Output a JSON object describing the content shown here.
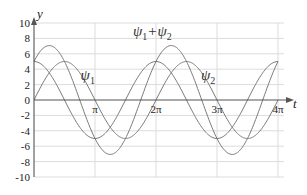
{
  "chart_data": {
    "type": "line",
    "title": "",
    "xlabel": "t",
    "ylabel": "y",
    "xlim": [
      0,
      12.566
    ],
    "ylim": [
      -10,
      10
    ],
    "grid": true,
    "x_ticks": [
      {
        "value": 3.1416,
        "label": "π"
      },
      {
        "value": 6.2832,
        "label": "2π"
      },
      {
        "value": 9.4248,
        "label": "3π"
      },
      {
        "value": 12.5664,
        "label": "4π"
      }
    ],
    "y_ticks": [
      {
        "value": 10,
        "label": "10"
      },
      {
        "value": 8,
        "label": "8"
      },
      {
        "value": 6,
        "label": "6"
      },
      {
        "value": 4,
        "label": "4"
      },
      {
        "value": 2,
        "label": "2"
      },
      {
        "value": 0,
        "label": "0"
      },
      {
        "value": -2,
        "label": "-2"
      },
      {
        "value": -4,
        "label": "-4"
      },
      {
        "value": -6,
        "label": "-6"
      },
      {
        "value": -8,
        "label": "-8"
      },
      {
        "value": -10,
        "label": "-10"
      }
    ],
    "series": [
      {
        "name": "ψ1",
        "label_main": "ψ",
        "label_sub": "1",
        "formula": "5cos(t)",
        "amplitude": 5,
        "phase": 1.5708,
        "label_at": [
          2.4,
          2.6
        ]
      },
      {
        "name": "ψ2",
        "label_main": "ψ",
        "label_sub": "2",
        "formula": "5sin(t)",
        "amplitude": 5,
        "phase": 0,
        "label_at": [
          8.6,
          2.6
        ]
      },
      {
        "name": "ψ1+ψ2",
        "label_main": "ψ",
        "label_sub": "1",
        "label_plus": "+ψ",
        "label_sub2": "2",
        "formula": "5cos(t)+5sin(t)",
        "amplitude": 7.071,
        "phase": 0.7854,
        "label_at": [
          5.1,
          8.3
        ]
      }
    ],
    "colors": {
      "curve": "#7a7a7a",
      "grid": "#dcdcdc",
      "axis": "#555555"
    }
  }
}
